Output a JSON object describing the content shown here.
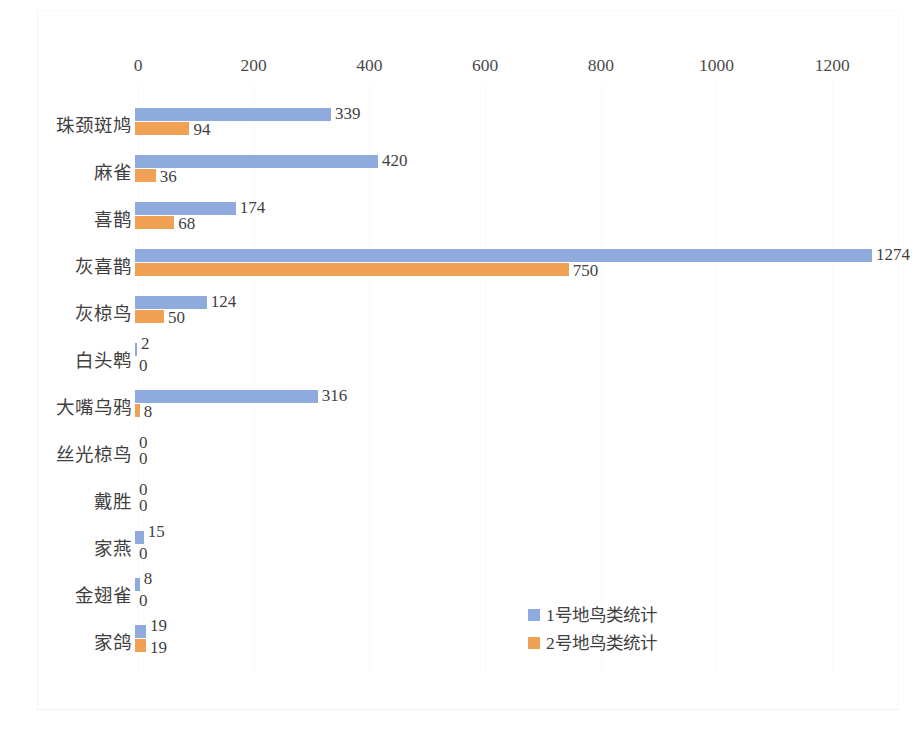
{
  "chart_data": {
    "type": "bar",
    "orientation": "horizontal",
    "title": "",
    "xlabel": "",
    "ylabel": "",
    "xlim": [
      0,
      1300
    ],
    "xticks": [
      0,
      200,
      400,
      600,
      800,
      1000,
      1200
    ],
    "grid": true,
    "legend_position": "inside-bottom-right",
    "categories": [
      "珠颈斑鸠",
      "麻雀",
      "喜鹊",
      "灰喜鹊",
      "灰椋鸟",
      "白头鹎",
      "大嘴乌鸦",
      "丝光椋鸟",
      "戴胜",
      "家燕",
      "金翅雀",
      "家鸽"
    ],
    "series": [
      {
        "name": "1号地鸟类统计",
        "color": "#8faadc",
        "values": [
          339,
          420,
          174,
          1274,
          124,
          2,
          316,
          0,
          0,
          15,
          8,
          19
        ]
      },
      {
        "name": "2号地鸟类统计",
        "color": "#f1a153",
        "values": [
          94,
          36,
          68,
          750,
          50,
          0,
          8,
          0,
          0,
          0,
          0,
          19
        ]
      }
    ],
    "data_labels": true
  },
  "axis": {
    "ticks": [
      "0",
      "200",
      "400",
      "600",
      "800",
      "1000",
      "1200"
    ]
  },
  "legend": {
    "items": [
      {
        "label": "1号地鸟类统计",
        "color": "#8faadc"
      },
      {
        "label": "2号地鸟类统计",
        "color": "#f1a153"
      }
    ]
  }
}
